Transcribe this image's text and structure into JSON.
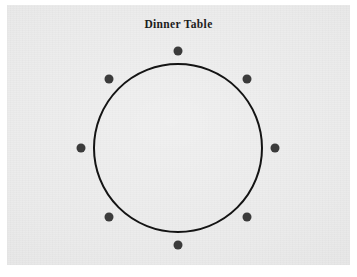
{
  "figure": {
    "title": "Dinner Table",
    "background_color": "#ffffff",
    "panel_color": "#e9e9e9"
  },
  "chart_data": {
    "type": "diagram",
    "title": "Dinner Table",
    "table": {
      "shape": "circle",
      "center_x": 178,
      "center_y": 148,
      "radius": 84,
      "stroke_color": "#141414",
      "stroke_width": 2,
      "fill": "none"
    },
    "seats": {
      "count": 8,
      "radius_from_center": 97,
      "dot_diameter": 9,
      "dot_color": "#3b3b3b",
      "angles_degrees": [
        270,
        315,
        0,
        45,
        90,
        135,
        180,
        225
      ],
      "positions": [
        {
          "label": "seat-1",
          "x": 178,
          "y": 51
        },
        {
          "label": "seat-2",
          "x": 247,
          "y": 79
        },
        {
          "label": "seat-3",
          "x": 275,
          "y": 148
        },
        {
          "label": "seat-4",
          "x": 247,
          "y": 217
        },
        {
          "label": "seat-5",
          "x": 178,
          "y": 245
        },
        {
          "label": "seat-6",
          "x": 109,
          "y": 217
        },
        {
          "label": "seat-7",
          "x": 81,
          "y": 148
        },
        {
          "label": "seat-8",
          "x": 109,
          "y": 79
        }
      ]
    },
    "xlabel": "",
    "ylabel": "",
    "grid": false,
    "legend": false
  }
}
